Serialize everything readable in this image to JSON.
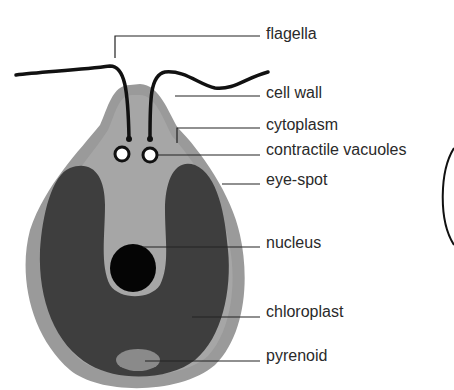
{
  "diagram": {
    "colors": {
      "cell_wall": "#9a9a9a",
      "cytoplasm": "#a8a8a8",
      "chloroplast": "#3e3e3e",
      "nucleus": "#050505",
      "pyrenoid": "#8a8a8a",
      "flagella": "#111111",
      "leader": "#222222",
      "text": "#2a2a2a"
    },
    "labels": [
      {
        "id": "flagella",
        "text": "flagella"
      },
      {
        "id": "cell-wall",
        "text": "cell wall"
      },
      {
        "id": "cytoplasm",
        "text": "cytoplasm"
      },
      {
        "id": "contractile-vacuoles",
        "text": "contractile vacuoles"
      },
      {
        "id": "eye-spot",
        "text": "eye-spot"
      },
      {
        "id": "nucleus",
        "text": "nucleus"
      },
      {
        "id": "chloroplast",
        "text": "chloroplast"
      },
      {
        "id": "pyrenoid",
        "text": "pyrenoid"
      }
    ]
  }
}
